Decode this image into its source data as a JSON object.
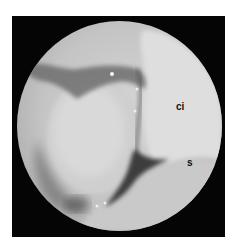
{
  "image": {
    "type": "arthroscopic-view",
    "labels": [
      {
        "id": "ci",
        "text": "ci"
      },
      {
        "id": "s",
        "text": "s"
      }
    ]
  }
}
